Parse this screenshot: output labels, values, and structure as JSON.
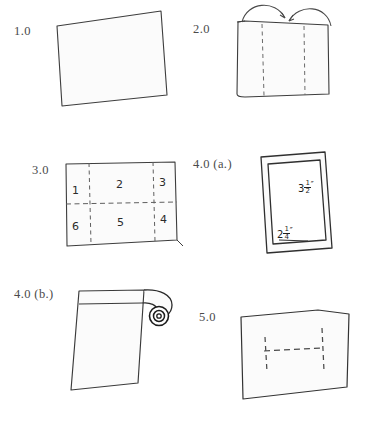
{
  "page": {
    "background_color": "#ffffff",
    "ink_color": "#3a3a3a",
    "paper_fill": "#fbfbfb",
    "width": 369,
    "height": 423
  },
  "steps": [
    {
      "id": "step-1",
      "label": "1.0",
      "description": "Blank rectangular sheet of paper, slightly tilted"
    },
    {
      "id": "step-2",
      "label": "2.0",
      "description": "Rectangle with two vertical dashed fold lines and two curved arrows folding the left and right thirds inward toward the center"
    },
    {
      "id": "step-3",
      "label": "3.0",
      "description": "Rectangle divided into a 3 by 2 grid of six numbered cells by dashed crease lines",
      "grid_cells": [
        {
          "cell": "1",
          "row": "top",
          "column": "left"
        },
        {
          "cell": "2",
          "row": "top",
          "column": "center"
        },
        {
          "cell": "3",
          "row": "top",
          "column": "right"
        },
        {
          "cell": "6",
          "row": "bottom",
          "column": "left"
        },
        {
          "cell": "5",
          "row": "bottom",
          "column": "center"
        },
        {
          "cell": "4",
          "row": "bottom",
          "column": "right"
        }
      ]
    },
    {
      "id": "step-4a",
      "label": "4.0 (a.)",
      "description": "Nested rectangles showing the folded packet with its finished dimensions marked",
      "dimensions": [
        {
          "name": "height",
          "whole": "3",
          "numerator": "1",
          "denominator": "2",
          "unit_mark": "″",
          "text": "3 1/2\""
        },
        {
          "name": "width",
          "whole": "2",
          "numerator": "1",
          "denominator": "4",
          "unit_mark": "″",
          "text": "2 1/4\""
        }
      ]
    },
    {
      "id": "step-4b",
      "label": "4.0 (b.)",
      "description": "Rectangle with the top edge rolled into a tight spiral curl at the upper right corner"
    },
    {
      "id": "step-5",
      "label": "5.0",
      "description": "Rectangle with dashed crease lines forming an H shape in the middle"
    }
  ]
}
